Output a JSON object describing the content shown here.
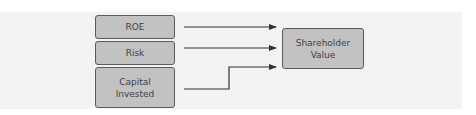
{
  "diagram": {
    "inputs": [
      {
        "label": "ROE"
      },
      {
        "label": "Risk"
      },
      {
        "label": "Capital\nInvested"
      }
    ],
    "output": {
      "label": "Shareholder\nValue"
    },
    "connections": [
      {
        "from": "ROE",
        "to": "Shareholder Value"
      },
      {
        "from": "Risk",
        "to": "Shareholder Value"
      },
      {
        "from": "Capital Invested",
        "to": "Shareholder Value"
      }
    ],
    "colors": {
      "box_fill": "#c2c2c2",
      "box_border": "#5a5a5a",
      "text": "#3f3f3f",
      "arrow": "#333333",
      "panel": "#f3f3f3"
    }
  }
}
